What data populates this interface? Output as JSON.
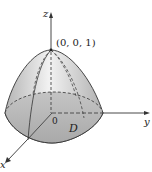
{
  "figure": {
    "labels": {
      "z_axis": "z",
      "y_axis": "y",
      "x_axis": "x",
      "origin": "0",
      "apex": "(0, 0, 1)",
      "region": "D"
    },
    "colors": {
      "surface_light": "#ececec",
      "surface_dark": "#a8a8a8",
      "base": "#b9b9b9",
      "line": "#333333"
    }
  }
}
